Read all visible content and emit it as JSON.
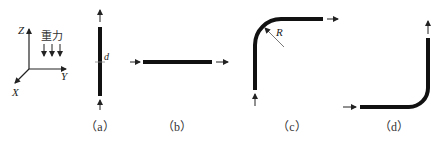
{
  "figure": {
    "axes": {
      "z_label": "Z",
      "y_label": "Y",
      "x_label": "X",
      "gravity_label": "重力",
      "gravity_arrow_count": 3
    },
    "panels": [
      {
        "id": "a",
        "caption": "（a）",
        "shape": "vertical straight pipe",
        "annotation": "d"
      },
      {
        "id": "b",
        "caption": "（b）",
        "shape": "horizontal straight pipe",
        "annotation": ""
      },
      {
        "id": "c",
        "caption": "（c）",
        "shape": "upward flow 90° bend to horizontal",
        "annotation": "R"
      },
      {
        "id": "d",
        "caption": "（d）",
        "shape": "horizontal flow 90° bend to upward",
        "annotation": ""
      }
    ],
    "colors": {
      "pipe": "#111111",
      "arrow": "#222222",
      "text": "#222222"
    }
  }
}
